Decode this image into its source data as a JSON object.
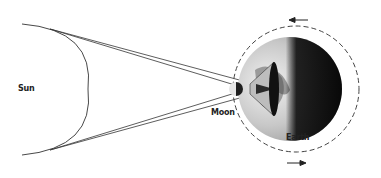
{
  "diagram": {
    "labels": {
      "sun": "Sun",
      "moon": "Moon",
      "earth": "Earth"
    },
    "colors": {
      "line": "#333333",
      "orbit": "#444444",
      "umbra": "#2a2a2a",
      "penumbra": "#bdbdbd",
      "earth_light": "#d8d8d8",
      "earth_dark": "#1a1a1a"
    },
    "elements": [
      {
        "id": "sun",
        "shape": "arc"
      },
      {
        "id": "moon",
        "shape": "circle"
      },
      {
        "id": "earth",
        "shape": "circle"
      },
      {
        "id": "moon-orbit",
        "shape": "dashed-circle"
      },
      {
        "id": "orbit-arrow-top",
        "direction": "left"
      },
      {
        "id": "orbit-arrow-bottom",
        "direction": "right"
      }
    ]
  }
}
